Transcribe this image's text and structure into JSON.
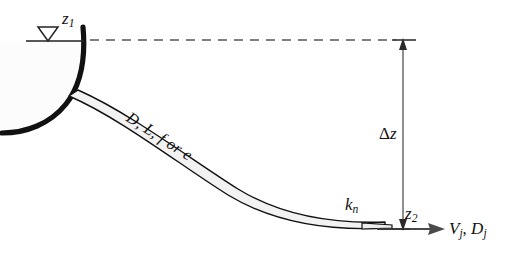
{
  "figure": {
    "background_color": "#ffffff",
    "line_color": "#111111",
    "pipe_fill_color": "#f2f2f2",
    "reservoir_fill_color": "#fbfbfb",
    "dashed_line_color": "#555555",
    "arrow_color": "#4a4a4a"
  },
  "labels": {
    "water_surface_elevation": "z",
    "water_surface_elevation_sub": "1",
    "elevation_difference_symbol": "Δ",
    "elevation_difference_var": "z",
    "outlet_elevation": "z",
    "outlet_elevation_sub": "2",
    "nozzle_loss_coefficient": "k",
    "nozzle_loss_coefficient_sub": "n",
    "pipe_properties": "D, L, f or e",
    "jet_velocity": "V",
    "jet_velocity_sub": "j",
    "jet_diameter": "D",
    "jet_diameter_sub": "j",
    "jet_separator": ", "
  },
  "icons": {
    "water_surface_symbol": "water-surface-triangle-icon",
    "vertical_dimension_arrow": "double-headed-vertical-arrow-icon",
    "jet_flow_arrow": "right-arrow-icon"
  },
  "geometry": {
    "water_surface_line_y": 40,
    "datum_line_y": 229,
    "dimension_arrow_x": 403,
    "delta_z_px": 189
  }
}
